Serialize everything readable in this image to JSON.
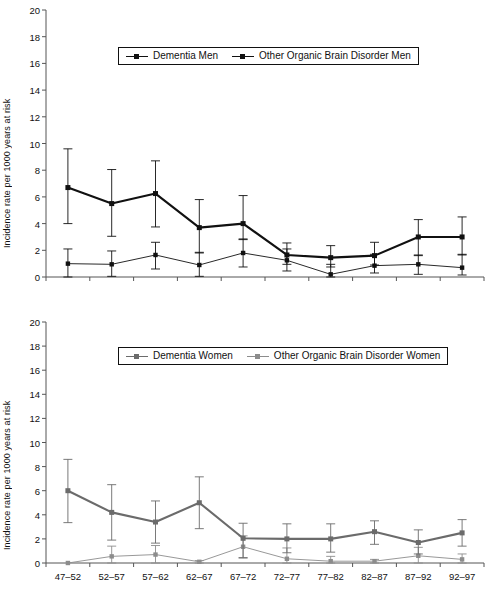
{
  "figure": {
    "background": "#ffffff",
    "panels": [
      "men",
      "women"
    ]
  },
  "chart_data": [
    {
      "type": "line",
      "id": "men",
      "title": "",
      "xlabel": "",
      "ylabel": "Incidence rate per 1000 years at risk",
      "categories": [
        "47–52",
        "52–57",
        "57–62",
        "62–67",
        "67–72",
        "72–77",
        "77–82",
        "82–87",
        "87–92",
        "92–97"
      ],
      "ylim": [
        0,
        20
      ],
      "yticks": [
        0,
        2,
        4,
        6,
        8,
        10,
        12,
        14,
        16,
        18,
        20
      ],
      "grid": false,
      "legend_position": "top-center",
      "series": [
        {
          "name": "Dementia Men",
          "color": "#111111",
          "line_width": 2.1,
          "marker": "square",
          "values": [
            6.7,
            5.5,
            6.25,
            3.7,
            4.0,
            1.65,
            1.45,
            1.6,
            3.0,
            3.0
          ],
          "err_low": [
            4.0,
            3.05,
            3.75,
            1.8,
            2.8,
            0.95,
            0.75,
            0.9,
            1.6,
            1.65
          ],
          "err_high": [
            9.6,
            8.05,
            8.7,
            5.8,
            6.1,
            2.55,
            2.35,
            2.6,
            4.3,
            4.5
          ]
        },
        {
          "name": "Other Organic Brain Disorder Men",
          "color": "#111111",
          "line_width": 0.9,
          "marker": "square",
          "values": [
            1.0,
            0.95,
            1.65,
            0.9,
            1.8,
            1.25,
            0.2,
            0.85,
            0.95,
            0.7
          ],
          "err_low": [
            0.0,
            0.05,
            0.6,
            0.05,
            0.75,
            0.45,
            0.0,
            0.3,
            0.2,
            0.15
          ],
          "err_high": [
            2.1,
            1.95,
            2.6,
            1.85,
            2.85,
            2.1,
            0.95,
            1.7,
            1.65,
            1.7
          ]
        }
      ]
    },
    {
      "type": "line",
      "id": "women",
      "title": "",
      "xlabel": "",
      "ylabel": "Incidence rate per 1000 years at risk",
      "categories": [
        "47–52",
        "52–57",
        "57–62",
        "62–67",
        "67–72",
        "72–77",
        "77–82",
        "82–87",
        "87–92",
        "92–97"
      ],
      "ylim": [
        0,
        20
      ],
      "yticks": [
        0,
        2,
        4,
        6,
        8,
        10,
        12,
        14,
        16,
        18,
        20
      ],
      "grid": false,
      "legend_position": "top-center",
      "series": [
        {
          "name": "Dementia Women",
          "color": "#6b6b6b",
          "line_width": 2.1,
          "marker": "square",
          "values": [
            6.0,
            4.2,
            3.4,
            5.0,
            2.05,
            2.0,
            2.0,
            2.6,
            1.7,
            2.5
          ],
          "err_low": [
            3.35,
            1.9,
            1.65,
            2.85,
            0.45,
            0.85,
            0.9,
            1.55,
            0.75,
            1.4
          ],
          "err_high": [
            8.6,
            6.5,
            5.15,
            7.15,
            3.3,
            3.25,
            3.25,
            3.5,
            2.75,
            3.6
          ]
        },
        {
          "name": "Other Organic Brain Disorder Women",
          "color": "#8c8c8c",
          "line_width": 0.9,
          "marker": "square",
          "values": [
            0.0,
            0.55,
            0.7,
            0.1,
            1.35,
            0.35,
            0.15,
            0.15,
            0.6,
            0.3
          ],
          "err_low": [
            0.0,
            0.0,
            0.0,
            0.0,
            0.4,
            0.0,
            0.0,
            0.0,
            0.0,
            0.0
          ],
          "err_high": [
            0.0,
            1.4,
            1.45,
            0.2,
            2.25,
            1.25,
            0.55,
            0.3,
            1.3,
            0.75
          ]
        }
      ]
    }
  ]
}
